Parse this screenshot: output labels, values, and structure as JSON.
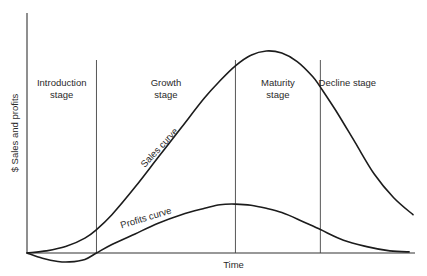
{
  "chart_data": {
    "type": "line",
    "title": "",
    "xlabel": "Time",
    "ylabel": "$ Sales and profits",
    "stages": [
      {
        "label_lines": [
          "Introduction",
          "stage"
        ]
      },
      {
        "label_lines": [
          "Growth",
          "stage"
        ]
      },
      {
        "label_lines": [
          "Maturity",
          "stage"
        ]
      },
      {
        "label_lines": [
          "Decline stage"
        ]
      }
    ],
    "stage_boundaries": [
      0.18,
      0.54,
      0.76
    ],
    "xlim": [
      0,
      1
    ],
    "ylim": [
      -0.05,
      1
    ],
    "series": [
      {
        "name": "Sales curve",
        "x": [
          0.0,
          0.05,
          0.1,
          0.15,
          0.18,
          0.22,
          0.28,
          0.34,
          0.4,
          0.46,
          0.5,
          0.54,
          0.58,
          0.62,
          0.66,
          0.7,
          0.74,
          0.76,
          0.8,
          0.85,
          0.9,
          0.95,
          1.0
        ],
        "values": [
          0.0,
          0.01,
          0.03,
          0.07,
          0.11,
          0.18,
          0.31,
          0.45,
          0.59,
          0.73,
          0.81,
          0.88,
          0.93,
          0.95,
          0.94,
          0.9,
          0.83,
          0.78,
          0.67,
          0.52,
          0.37,
          0.26,
          0.18
        ]
      },
      {
        "name": "Profits curve",
        "x": [
          0.0,
          0.04,
          0.08,
          0.11,
          0.15,
          0.18,
          0.22,
          0.28,
          0.34,
          0.4,
          0.46,
          0.5,
          0.54,
          0.58,
          0.62,
          0.66,
          0.7,
          0.76,
          0.82,
          0.88,
          0.94,
          0.99
        ],
        "values": [
          0.0,
          -0.025,
          -0.04,
          -0.042,
          -0.03,
          0.0,
          0.04,
          0.09,
          0.14,
          0.18,
          0.21,
          0.227,
          0.23,
          0.225,
          0.21,
          0.19,
          0.16,
          0.11,
          0.06,
          0.03,
          0.01,
          0.005
        ]
      }
    ],
    "annotations": [
      {
        "text": "Sales curve",
        "attached_to": "Sales curve"
      },
      {
        "text": "Profits curve",
        "attached_to": "Profits curve"
      }
    ],
    "grid": false,
    "legend": "none"
  }
}
